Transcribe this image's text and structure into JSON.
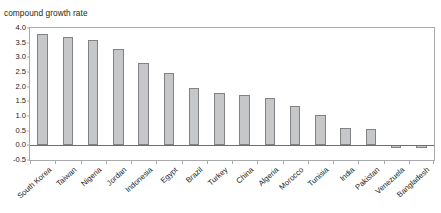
{
  "chart_data": {
    "type": "bar",
    "title": "",
    "xlabel": "",
    "ylabel": "compound growth rate",
    "ylim": [
      -0.5,
      4.0
    ],
    "ytick_labels": [
      "4.0",
      "3.5",
      "3.0",
      "2.5",
      "2.0",
      "1.5",
      "1.0",
      "0.5",
      "0.0",
      "-0.5"
    ],
    "ytick_values": [
      4.0,
      3.5,
      3.0,
      2.5,
      2.0,
      1.5,
      1.0,
      0.5,
      0.0,
      -0.5
    ],
    "grid": false,
    "legend": "none",
    "categories": [
      "South Korea",
      "Taiwan",
      "Nigeria",
      "Jordan",
      "Indonesia",
      "Egypt",
      "Brazil",
      "Turkey",
      "China",
      "Algeria",
      "Morocco",
      "Tunisia",
      "India",
      "Pakistan",
      "Venezuela",
      "Bangladesh"
    ],
    "values": [
      3.8,
      3.7,
      3.6,
      3.3,
      2.8,
      2.45,
      1.95,
      1.8,
      1.7,
      1.6,
      1.35,
      1.05,
      0.6,
      0.55,
      -0.1,
      -0.1
    ],
    "bar_fill_color": "#c6c7c8",
    "bar_border_color": "#808285",
    "axis_color": "#a7a9ac",
    "baseline_color": "#6d6e71",
    "text_color": "#231f20"
  }
}
